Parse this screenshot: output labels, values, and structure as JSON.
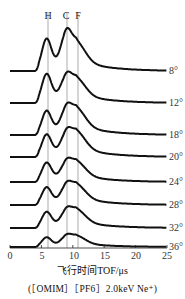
{
  "chart_data": {
    "type": "line",
    "title": "",
    "xlabel": "飞行时间TOF/μs",
    "ylabel": "",
    "caption": "(［OMIM］［PF6］2.0keV Ne⁺)",
    "xlim": [
      0,
      25
    ],
    "x_ticks": [
      "0",
      "5",
      "10",
      "15",
      "20",
      "25"
    ],
    "grid": false,
    "legend": "none; series labelled at right end",
    "peak_markers": [
      {
        "label": "H",
        "x": 5.8
      },
      {
        "label": "C",
        "x": 8.9
      },
      {
        "label": "F",
        "x": 10.6
      }
    ],
    "series": [
      {
        "name": "8°",
        "baseline_offset": 7,
        "peaks": {
          "H": 1.0,
          "C": 0.95,
          "F": 0.7
        }
      },
      {
        "name": "12°",
        "baseline_offset": 6,
        "peaks": {
          "H": 0.9,
          "C": 0.62,
          "F": 0.6
        }
      },
      {
        "name": "18°",
        "baseline_offset": 5,
        "peaks": {
          "H": 0.75,
          "C": 0.62,
          "F": 0.65
        }
      },
      {
        "name": "20°",
        "baseline_offset": 4,
        "peaks": {
          "H": 0.7,
          "C": 0.55,
          "F": 0.62
        }
      },
      {
        "name": "24°",
        "baseline_offset": 3,
        "peaks": {
          "H": 0.6,
          "C": 0.45,
          "F": 0.5
        }
      },
      {
        "name": "28°",
        "baseline_offset": 2,
        "peaks": {
          "H": 0.55,
          "C": 0.45,
          "F": 0.5
        }
      },
      {
        "name": "32°",
        "baseline_offset": 1,
        "peaks": {
          "H": 0.5,
          "C": 0.4,
          "F": 0.45
        }
      },
      {
        "name": "36°",
        "baseline_offset": 0,
        "peaks": {
          "H": 0.3,
          "C": 0.25,
          "F": 0.27
        }
      }
    ]
  },
  "labels": {
    "xlabel": "飞行时间TOF/μs",
    "caption": "(［OMIM］［PF6］2.0keV Ne⁺)",
    "peaks": [
      "H",
      "C",
      "F"
    ],
    "ticks": [
      "0",
      "5",
      "10",
      "15",
      "20",
      "25"
    ],
    "angles": [
      "8°",
      "12°",
      "18°",
      "20°",
      "24°",
      "28°",
      "32°",
      "36°"
    ]
  }
}
